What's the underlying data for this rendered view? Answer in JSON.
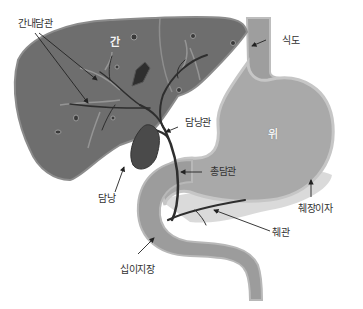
{
  "diagram": {
    "title": "",
    "colors": {
      "liver": "#6e6e6e",
      "liver_edge": "#8a8a8a",
      "liver_vessel": "#9a9a9a",
      "gallbladder": "#4a4a4a",
      "duct": "#2e2e2e",
      "stomach": "#a9a9a9",
      "stomach_edge": "#c4c4c4",
      "esophagus": "#a0a0a0",
      "duodenum": "#9c9c9c",
      "pancreas": "#d4d4d4",
      "label_text": "#333333",
      "arrow": "#222222"
    },
    "organs": [
      {
        "id": "liver",
        "label": "간"
      },
      {
        "id": "stomach",
        "label": "위"
      },
      {
        "id": "esophagus",
        "label": "식도"
      },
      {
        "id": "gallbladder",
        "label": "담낭"
      },
      {
        "id": "cystic-duct",
        "label": "담낭관"
      },
      {
        "id": "common-bile-duct",
        "label": "총담관"
      },
      {
        "id": "intrahepatic-bile-ducts",
        "label": "간내담관"
      },
      {
        "id": "pancreas",
        "label": "췌장이자"
      },
      {
        "id": "pancreatic-duct",
        "label": "췌관"
      },
      {
        "id": "duodenum",
        "label": "십이지장"
      }
    ],
    "labels": {
      "liver": "간",
      "stomach": "위",
      "esophagus": "식도",
      "gallbladder": "담낭",
      "cystic_duct": "담낭관",
      "common_bile_duct": "총담관",
      "intrahepatic_ducts": "간내담관",
      "pancreas": "췌장이자",
      "pancreatic_duct": "췌관",
      "duodenum": "십이지장"
    }
  }
}
